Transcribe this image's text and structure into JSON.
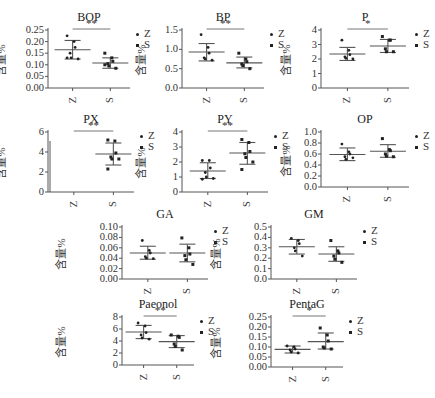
{
  "ylabel": "含量%",
  "legend": [
    {
      "label": "Z",
      "marker": "dot"
    },
    {
      "label": "S",
      "marker": "square"
    }
  ],
  "colors": {
    "axis": "#555555",
    "mean_bar": "#555555",
    "points": "#222222",
    "sig_line": "#777777"
  },
  "chart_data": [
    {
      "type": "scatter",
      "title": "BOP",
      "xlabel": "",
      "ylabel": "含量%",
      "categories": [
        "Z",
        "S"
      ],
      "ylim": [
        0,
        0.25
      ],
      "yticks": [
        "0.00",
        "0.05",
        "0.10",
        "0.15",
        "0.20",
        "0.25"
      ],
      "series": [
        {
          "name": "Z",
          "mean": 0.165,
          "sd_low": 0.125,
          "sd_high": 0.205,
          "points": [
            0.225,
            0.2,
            0.175,
            0.15,
            0.13,
            0.125,
            0.13
          ]
        },
        {
          "name": "S",
          "mean": 0.108,
          "sd_low": 0.085,
          "sd_high": 0.13,
          "points": [
            0.15,
            0.13,
            0.115,
            0.105,
            0.095,
            0.085,
            0.1
          ]
        }
      ],
      "significance": "**"
    },
    {
      "type": "scatter",
      "title": "BP",
      "xlabel": "",
      "ylabel": "含量%",
      "categories": [
        "Z",
        "S"
      ],
      "ylim": [
        0,
        1.5
      ],
      "yticks": [
        "0.0",
        "0.5",
        "1.0",
        "1.5"
      ],
      "series": [
        {
          "name": "Z",
          "mean": 0.93,
          "sd_low": 0.7,
          "sd_high": 1.15,
          "points": [
            1.38,
            1.05,
            0.9,
            0.78,
            0.75,
            0.72
          ]
        },
        {
          "name": "S",
          "mean": 0.65,
          "sd_low": 0.52,
          "sd_high": 0.8,
          "points": [
            0.9,
            0.75,
            0.68,
            0.62,
            0.58,
            0.5
          ]
        }
      ],
      "significance": "**"
    },
    {
      "type": "scatter",
      "title": "P",
      "xlabel": "",
      "ylabel": "含量%",
      "categories": [
        "Z",
        "S"
      ],
      "ylim": [
        0,
        4
      ],
      "yticks": [
        "0",
        "1",
        "2",
        "3",
        "4"
      ],
      "series": [
        {
          "name": "Z",
          "mean": 2.35,
          "sd_low": 1.9,
          "sd_high": 2.8,
          "points": [
            3.3,
            2.6,
            2.3,
            2.15,
            2.05,
            2.0
          ]
        },
        {
          "name": "S",
          "mean": 2.9,
          "sd_low": 2.45,
          "sd_high": 3.35,
          "points": [
            3.55,
            3.3,
            3.3,
            2.7,
            2.5,
            2.5
          ]
        }
      ],
      "significance": "*"
    },
    {
      "type": "scatter",
      "title": "PX",
      "xlabel": "",
      "ylabel": "含量%",
      "categories": [
        "Z",
        "S"
      ],
      "ylim": [
        0,
        6
      ],
      "yticks": [
        "0",
        "2",
        "4",
        "6"
      ],
      "series": [
        {
          "name": "Z",
          "mean": null,
          "sd_low": null,
          "sd_high": null,
          "points": []
        },
        {
          "name": "S",
          "mean": 3.8,
          "sd_low": 2.7,
          "sd_high": 4.9,
          "points": [
            5.2,
            5.1,
            3.9,
            3.5,
            3.3,
            3.3,
            2.3
          ]
        }
      ],
      "significance": "**"
    },
    {
      "type": "scatter",
      "title": "PY",
      "xlabel": "",
      "ylabel": "含量%",
      "categories": [
        "Z",
        "S"
      ],
      "ylim": [
        0,
        4
      ],
      "yticks": [
        "0",
        "1",
        "2",
        "3",
        "4"
      ],
      "series": [
        {
          "name": "Z",
          "mean": 1.4,
          "sd_low": 0.9,
          "sd_high": 1.95,
          "points": [
            2.1,
            2.1,
            1.6,
            1.3,
            1.0,
            0.9,
            0.85
          ]
        },
        {
          "name": "S",
          "mean": 2.6,
          "sd_low": 1.85,
          "sd_high": 3.3,
          "points": [
            3.5,
            3.3,
            2.7,
            2.55,
            2.3,
            2.0,
            1.5
          ]
        }
      ],
      "significance": "**"
    },
    {
      "type": "scatter",
      "title": "OP",
      "xlabel": "",
      "ylabel": "含量%",
      "categories": [
        "Z",
        "S"
      ],
      "ylim": [
        0,
        1.0
      ],
      "yticks": [
        "0.0",
        "0.2",
        "0.4",
        "0.6",
        "0.8",
        "1.0"
      ],
      "series": [
        {
          "name": "Z",
          "mean": 0.59,
          "sd_low": 0.48,
          "sd_high": 0.71,
          "points": [
            0.78,
            0.64,
            0.6,
            0.55,
            0.5,
            0.53
          ]
        },
        {
          "name": "S",
          "mean": 0.65,
          "sd_low": 0.54,
          "sd_high": 0.77,
          "points": [
            0.88,
            0.68,
            0.66,
            0.6,
            0.56,
            0.55
          ]
        }
      ],
      "significance": ""
    },
    {
      "type": "scatter",
      "title": "GA",
      "xlabel": "",
      "ylabel": "含量%",
      "categories": [
        "Z",
        "S"
      ],
      "ylim": [
        0,
        0.1
      ],
      "yticks": [
        "0.00",
        "0.02",
        "0.04",
        "0.06",
        "0.08",
        "0.10"
      ],
      "series": [
        {
          "name": "Z",
          "mean": 0.05,
          "sd_low": 0.038,
          "sd_high": 0.063,
          "points": [
            0.074,
            0.055,
            0.05,
            0.043,
            0.04,
            0.039
          ]
        },
        {
          "name": "S",
          "mean": 0.05,
          "sd_low": 0.033,
          "sd_high": 0.067,
          "points": [
            0.079,
            0.06,
            0.048,
            0.045,
            0.037,
            0.028
          ]
        }
      ],
      "significance": ""
    },
    {
      "type": "scatter",
      "title": "GM",
      "xlabel": "",
      "ylabel": "含量%",
      "categories": [
        "Z",
        "S"
      ],
      "ylim": [
        0,
        0.5
      ],
      "yticks": [
        "0.0",
        "0.1",
        "0.2",
        "0.3",
        "0.4",
        "0.5"
      ],
      "series": [
        {
          "name": "Z",
          "mean": 0.31,
          "sd_low": 0.24,
          "sd_high": 0.38,
          "points": [
            0.39,
            0.37,
            0.34,
            0.3,
            0.27,
            0.22
          ]
        },
        {
          "name": "S",
          "mean": 0.24,
          "sd_low": 0.17,
          "sd_high": 0.31,
          "points": [
            0.37,
            0.27,
            0.25,
            0.22,
            0.19,
            0.16
          ]
        }
      ],
      "significance": ""
    },
    {
      "type": "scatter",
      "title": "Paeonol",
      "xlabel": "",
      "ylabel": "含量%",
      "categories": [
        "Z",
        "S"
      ],
      "ylim": [
        0,
        8
      ],
      "yticks": [
        "0",
        "2",
        "4",
        "6",
        "8"
      ],
      "series": [
        {
          "name": "Z",
          "mean": 5.5,
          "sd_low": 4.4,
          "sd_high": 6.6,
          "points": [
            7.0,
            6.5,
            5.4,
            5.0,
            4.5,
            4.3
          ]
        },
        {
          "name": "S",
          "mean": 3.9,
          "sd_low": 2.9,
          "sd_high": 4.9,
          "points": [
            5.0,
            4.8,
            4.6,
            3.5,
            3.1,
            2.5
          ]
        }
      ],
      "significance": "**"
    },
    {
      "type": "scatter",
      "title": "PentaG",
      "xlabel": "",
      "ylabel": "含量%",
      "categories": [
        "Z",
        "S"
      ],
      "ylim": [
        0,
        0.25
      ],
      "yticks": [
        "0.00",
        "0.05",
        "0.10",
        "0.15",
        "0.20",
        "0.25"
      ],
      "series": [
        {
          "name": "Z",
          "mean": 0.088,
          "sd_low": 0.07,
          "sd_high": 0.105,
          "points": [
            0.105,
            0.1,
            0.09,
            0.085,
            0.075,
            0.07
          ]
        },
        {
          "name": "S",
          "mean": 0.127,
          "sd_low": 0.09,
          "sd_high": 0.17,
          "points": [
            0.195,
            0.16,
            0.13,
            0.1,
            0.095,
            0.09
          ]
        }
      ],
      "significance": "*"
    }
  ],
  "layout": [
    {
      "x": 0,
      "y": 8,
      "ticks_w": 44,
      "plot_w": 82,
      "plot_h": 58
    },
    {
      "x": 140,
      "y": 8,
      "ticks_w": 38,
      "plot_w": 82,
      "plot_h": 58
    },
    {
      "x": 285,
      "y": 8,
      "ticks_w": 32,
      "plot_w": 88,
      "plot_h": 58
    },
    {
      "x": 0,
      "y": 110,
      "ticks_w": 44,
      "plot_w": 86,
      "plot_h": 60
    },
    {
      "x": 140,
      "y": 110,
      "ticks_w": 38,
      "plot_w": 86,
      "plot_h": 60
    },
    {
      "x": 285,
      "y": 110,
      "ticks_w": 32,
      "plot_w": 88,
      "plot_h": 55
    },
    {
      "x": 60,
      "y": 205,
      "ticks_w": 58,
      "plot_w": 86,
      "plot_h": 52
    },
    {
      "x": 215,
      "y": 205,
      "ticks_w": 52,
      "plot_w": 86,
      "plot_h": 52
    },
    {
      "x": 60,
      "y": 295,
      "ticks_w": 58,
      "plot_w": 72,
      "plot_h": 48
    },
    {
      "x": 215,
      "y": 295,
      "ticks_w": 52,
      "plot_w": 72,
      "plot_h": 50
    }
  ]
}
